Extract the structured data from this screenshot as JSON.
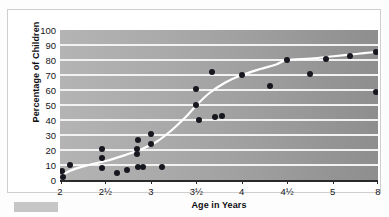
{
  "figure": {
    "caption_swatch": "",
    "frame_color": "#cfcfcf",
    "plot_bg_left": "#b4b4b4",
    "plot_bg_right": "#8e8e8e",
    "gridline_color": "#f2f2f2",
    "marker_color": "#17171f",
    "trend_color": "#ffffff"
  },
  "chart_data": {
    "type": "scatter",
    "title": "",
    "xlabel": "Age in Years",
    "ylabel": "Percentage of Children",
    "grid": true,
    "legend": "none",
    "ylim": [
      0,
      100
    ],
    "yticks": [
      0,
      10,
      20,
      30,
      40,
      50,
      60,
      70,
      80,
      90,
      100
    ],
    "ytick_labels": [
      "0",
      "10",
      "20",
      "30",
      "40",
      "50",
      "60",
      "70",
      "80",
      "90",
      "100"
    ],
    "xtick_labels": [
      "2",
      "2½",
      "3",
      "3½",
      "4",
      "4½",
      "5",
      "8"
    ],
    "xtick_positions": [
      0.0,
      0.1429,
      0.2857,
      0.4286,
      0.5714,
      0.7143,
      0.8571,
      1.0
    ],
    "x_axis_note": "category axis, evenly spaced ticks",
    "points": [
      {
        "x": -0.022,
        "y": 1
      },
      {
        "x": 0.005,
        "y": 6
      },
      {
        "x": 0.008,
        "y": 2
      },
      {
        "x": 0.03,
        "y": 10
      },
      {
        "x": 0.131,
        "y": 21
      },
      {
        "x": 0.131,
        "y": 15
      },
      {
        "x": 0.133,
        "y": 8
      },
      {
        "x": 0.178,
        "y": 4.5
      },
      {
        "x": 0.211,
        "y": 7
      },
      {
        "x": 0.245,
        "y": 27
      },
      {
        "x": 0.243,
        "y": 21
      },
      {
        "x": 0.243,
        "y": 17.5
      },
      {
        "x": 0.245,
        "y": 9
      },
      {
        "x": 0.26,
        "y": 9
      },
      {
        "x": 0.286,
        "y": 31
      },
      {
        "x": 0.286,
        "y": 24
      },
      {
        "x": 0.32,
        "y": 9
      },
      {
        "x": 0.428,
        "y": 61
      },
      {
        "x": 0.428,
        "y": 50
      },
      {
        "x": 0.436,
        "y": 40
      },
      {
        "x": 0.477,
        "y": 72
      },
      {
        "x": 0.486,
        "y": 42
      },
      {
        "x": 0.51,
        "y": 43
      },
      {
        "x": 0.572,
        "y": 70
      },
      {
        "x": 0.66,
        "y": 63
      },
      {
        "x": 0.714,
        "y": 80
      },
      {
        "x": 0.787,
        "y": 71
      },
      {
        "x": 0.835,
        "y": 81
      },
      {
        "x": 0.912,
        "y": 83
      },
      {
        "x": 0.993,
        "y": 85.5
      },
      {
        "x": 0.993,
        "y": 59
      }
    ],
    "trend_line": {
      "label": "fitted curve",
      "points": [
        {
          "x": -0.03,
          "y": -2
        },
        {
          "x": 0.03,
          "y": 6
        },
        {
          "x": 0.09,
          "y": 10
        },
        {
          "x": 0.15,
          "y": 13
        },
        {
          "x": 0.21,
          "y": 17
        },
        {
          "x": 0.25,
          "y": 20
        },
        {
          "x": 0.3,
          "y": 25
        },
        {
          "x": 0.35,
          "y": 33
        },
        {
          "x": 0.4,
          "y": 43
        },
        {
          "x": 0.43,
          "y": 50
        },
        {
          "x": 0.47,
          "y": 58
        },
        {
          "x": 0.52,
          "y": 65
        },
        {
          "x": 0.572,
          "y": 70
        },
        {
          "x": 0.63,
          "y": 74
        },
        {
          "x": 0.68,
          "y": 77
        },
        {
          "x": 0.714,
          "y": 80
        },
        {
          "x": 0.79,
          "y": 81
        },
        {
          "x": 0.86,
          "y": 82.5
        },
        {
          "x": 0.93,
          "y": 84
        },
        {
          "x": 1.0,
          "y": 85.5
        }
      ]
    }
  }
}
